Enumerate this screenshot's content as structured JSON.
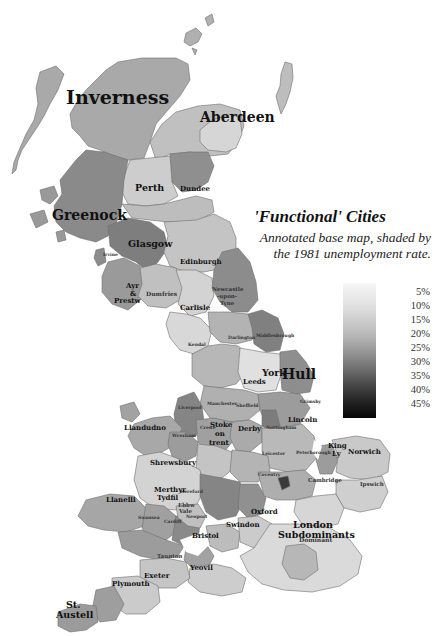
{
  "title": "'Functional' Cities",
  "subtitle": "Annotated base map, shaded by the 1981 unemployment rate.",
  "legend": {
    "label": "Unemployment rate",
    "ticks": [
      "5%",
      "10%",
      "15%",
      "20%",
      "25%",
      "30%",
      "35%",
      "40%",
      "45%"
    ],
    "color_low": "#f6f6f6",
    "color_high": "#060606"
  },
  "cities_large": [
    "Inverness",
    "Aberdeen",
    "Greenock",
    "Hull",
    "St. Austell"
  ],
  "cities_medium": [
    "Perth",
    "Dundee",
    "Glasgow",
    "Edinburgh",
    "Dumfries",
    "Carlisle",
    "Newcastle -upon- Tyne",
    "Ayr & Prestwick",
    "York",
    "Leeds",
    "Lincoln",
    "Stoke on trent",
    "Derby",
    "Shrewsbury",
    "Llandudno",
    "Llanelli",
    "Merthyr Tydfil",
    "Ebbw Vale",
    "Bristol",
    "Swindon",
    "Oxford",
    "Cambridge",
    "King's Lynn",
    "Norwich",
    "London Subdominants",
    "London Dominant",
    "Exeter",
    "Plymouth",
    "Yeovil",
    "Kendal",
    "Darlington",
    "Crewe",
    "Wrexham",
    "Ipswich",
    "Taunton",
    "Newport",
    "Cardiff",
    "Swansea",
    "Hereford",
    "Coventry",
    "Leicester",
    "Peterborough",
    "Grimsby",
    "Middlesbrough",
    "Manchester",
    "Sheffield",
    "Liverpool",
    "Irvine"
  ],
  "labels": {
    "inverness": "Inverness",
    "aberdeen": "Aberdeen",
    "perth": "Perth",
    "dundee": "Dundee",
    "greenock": "Greenock",
    "glasgow": "Glasgow",
    "irvine": "Irvine",
    "edinburgh": "Edinburgh",
    "ayr1": "Ayr",
    "ayr2": "&",
    "ayr3": "Prestw",
    "dumfries": "Dumfries",
    "carlisle": "Carlisle",
    "newcastle1": "Newcastle",
    "newcastle2": "-upon-",
    "newcastle3": "Tyne",
    "kendal": "Kendal",
    "darlington": "Darlington",
    "middlesbrough": "Middlesbrough",
    "york": "York",
    "hull": "Hull",
    "leeds": "Leeds",
    "manchester": "Manchester",
    "sheffield": "Sheffield",
    "grimsby": "Grimsby",
    "lincoln": "Lincoln",
    "liverpool": "Liverpool",
    "llandudno": "Llandudno",
    "wrexham": "Wrexham",
    "crewe": "Crewe",
    "stoke1": "Stoke",
    "stoke2": "on",
    "stoke3": "trent",
    "derby": "Derby",
    "nottingham": "Nottingham",
    "leicester": "Leicester",
    "shrewsbury": "Shrewsbury",
    "coventry": "Coventry",
    "peterborough": "Peterborough",
    "kinglynn1": "King",
    "kinglynn2": "Ly",
    "norwich": "Norwich",
    "cambridge": "Cambridge",
    "ipswich": "Ipswich",
    "hereford": "Hereford",
    "merthyr1": "Merthyr",
    "merthyr2": "Tydfil",
    "ebbw1": "Ebbw",
    "ebbw2": "Vale",
    "newport": "Newport",
    "llanelli": "Llanelli",
    "swansea": "Swansea",
    "cardiff": "Cardiff",
    "bristol": "Bristol",
    "swindon": "Swindon",
    "oxford": "Oxford",
    "london1": "London",
    "london2": "Subdominants",
    "london3": "Dominant",
    "taunton": "Taunton",
    "yeovil": "Yeovil",
    "exeter": "Exeter",
    "plymouth": "Plymouth",
    "staustell1": "St.",
    "staustell2": "Austell"
  },
  "region_shades": {
    "highland": "#a9a9a9",
    "grampian": "#d0d0d0",
    "tayside": "#8f8f8f",
    "central": "#bdbdbd",
    "strathclyde": "#7f7f7f",
    "lothian": "#c4c4c4",
    "borders_dumfries": "#b8b8b8",
    "north_england": "#9e9e9e",
    "yorkshire": "#b5b5b5",
    "york_light": "#dedede",
    "hull": "#8a8a8a",
    "teesside": "#7a7a7a",
    "midlands": "#a3a3a3",
    "birmingham": "#858585",
    "wales_north": "#a0a0a0",
    "wales_mid": "#d3d3d3",
    "wales_south": "#999999",
    "east_anglia": "#cfcfcf",
    "southeast": "#dadada",
    "london_core": "#b7b7b7",
    "southwest": "#c8c8c8",
    "cornwall": "#9b9b9b",
    "islands": "#b0b0b0",
    "dark_spot": "#3a3a3a"
  }
}
